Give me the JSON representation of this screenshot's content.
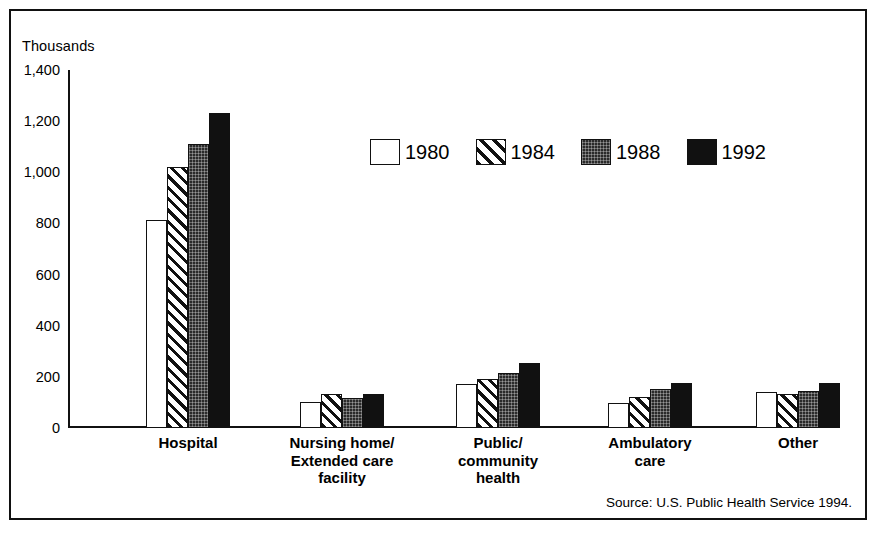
{
  "figure": {
    "units_label": "Thousands",
    "source_note": "Source: U.S. Public Health Service 1994."
  },
  "axis": {
    "y_ticks": [
      "1,400",
      "1,200",
      "1,000",
      "800",
      "600",
      "400",
      "200",
      "0"
    ]
  },
  "legend": {
    "items": [
      {
        "label": "1980",
        "pattern": "open-white",
        "swatch_name": "legend-swatch-1980"
      },
      {
        "label": "1984",
        "pattern": "diagonal-hatch",
        "swatch_name": "legend-swatch-1984"
      },
      {
        "label": "1988",
        "pattern": "dense-dotted-dark",
        "swatch_name": "legend-swatch-1988"
      },
      {
        "label": "1992",
        "pattern": "solid-black",
        "swatch_name": "legend-swatch-1992"
      }
    ]
  },
  "chart_data": {
    "type": "bar",
    "title": "",
    "subtitle": "",
    "xlabel": "",
    "ylabel": "Thousands",
    "ylim": [
      0,
      1400
    ],
    "ytick_step": 200,
    "grid": false,
    "legend_position": "upper-center",
    "categories": [
      "Hospital",
      "Nursing home/\nExtended care\nfacility",
      "Public/\ncommunity\nhealth",
      "Ambulatory\ncare",
      "Other"
    ],
    "series": [
      {
        "name": "1980",
        "values": [
          815,
          100,
          172,
          98,
          140
        ]
      },
      {
        "name": "1984",
        "values": [
          1020,
          133,
          192,
          122,
          133
        ]
      },
      {
        "name": "1988",
        "values": [
          1110,
          118,
          215,
          152,
          146
        ]
      },
      {
        "name": "1992",
        "values": [
          1233,
          133,
          255,
          175,
          175
        ]
      }
    ],
    "annotations": [
      "Source: U.S. Public Health Service 1994."
    ]
  }
}
